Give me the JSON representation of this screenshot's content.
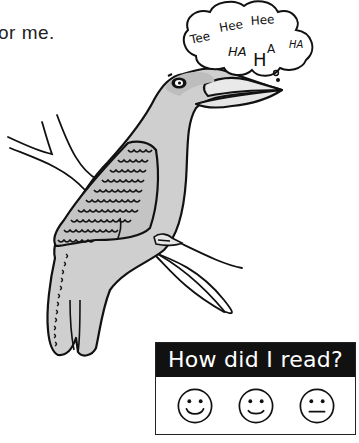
{
  "caption": {
    "text": "or  me."
  },
  "speech_bubble": {
    "lines": [
      "Tee",
      "Hee",
      "Hee",
      "HA",
      "H",
      "A",
      "HA"
    ]
  },
  "illustration": {
    "subject": "kookaburra-laughing-on-branch",
    "colors": {
      "body": "#cfcfcf",
      "outline": "#111111",
      "background": "#ffffff"
    }
  },
  "rating": {
    "title": "How did I read?",
    "header_color": "#111111",
    "faces": [
      {
        "name": "happy-face",
        "mood": "great"
      },
      {
        "name": "smile-face",
        "mood": "good"
      },
      {
        "name": "neutral-face",
        "mood": "okay"
      }
    ]
  }
}
